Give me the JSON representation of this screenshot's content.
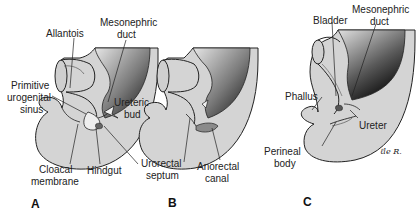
{
  "figure": {
    "panels": [
      {
        "letter": "A",
        "labels": {
          "allantois": "Allantois",
          "mesonephric_duct_1": "Mesonephric",
          "mesonephric_duct_2": "duct",
          "primitive_urogenital_sinus_1": "Primitive",
          "primitive_urogenital_sinus_2": "urogenital",
          "primitive_urogenital_sinus_3": "sinus",
          "ureteric_bud_1": "Ureteric",
          "ureteric_bud_2": "bud",
          "cloacal_membrane_1": "Cloacal",
          "cloacal_membrane_2": "membrane",
          "hindgut": "Hindgut"
        }
      },
      {
        "letter": "B",
        "labels": {
          "urorectal_septum_1": "Urorectal",
          "urorectal_septum_2": "septum",
          "anorectal_canal_1": "Anorectal",
          "anorectal_canal_2": "canal"
        }
      },
      {
        "letter": "C",
        "labels": {
          "bladder": "Bladder",
          "mesonephric_duct_1": "Mesonephric",
          "mesonephric_duct_2": "duct",
          "phallus": "Phallus",
          "ureter": "Ureter",
          "perineal_body_1": "Perineal",
          "perineal_body_2": "body",
          "signature": "ℓle R."
        }
      }
    ],
    "colors": {
      "tissue_fill": "#d4d4d4",
      "lumen_fill": "#bdbdbd",
      "dark_gradient": "#1a1a1a",
      "outline": "#222222",
      "background": "#ffffff"
    }
  }
}
